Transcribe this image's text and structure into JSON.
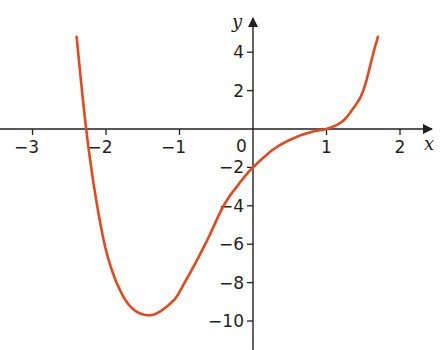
{
  "chart_data": {
    "type": "line",
    "title": "",
    "xlabel": "x",
    "ylabel": "y",
    "xlim": [
      -3.4,
      2.5
    ],
    "ylim": [
      -11.6,
      5.8
    ],
    "grid": false,
    "legend": null,
    "x_ticks": [
      -3,
      -2,
      -1,
      1,
      2
    ],
    "x_tick_labels": [
      "−3",
      "−2",
      "−1",
      "1",
      "2"
    ],
    "y_ticks": [
      4,
      2,
      -2,
      -4,
      -6,
      -8,
      -10
    ],
    "y_tick_labels": [
      "4",
      "2",
      "−2",
      "−4",
      "−6",
      "−8",
      "−10"
    ],
    "origin_label": "0",
    "series": [
      {
        "name": "curve",
        "color": "#e8471c",
        "x": [
          -2.4,
          -2.27,
          -2.12,
          -1.95,
          -1.7,
          -1.4,
          -1.1,
          -0.93,
          -0.65,
          -0.4,
          -0.2,
          0.0,
          0.3,
          0.6,
          0.85,
          1.0,
          1.2,
          1.35,
          1.5,
          1.64,
          1.7
        ],
        "y": [
          4.8,
          0.0,
          -4.0,
          -7.0,
          -9.1,
          -9.7,
          -9.0,
          -8.0,
          -6.0,
          -4.0,
          -2.9,
          -2.0,
          -1.0,
          -0.4,
          -0.1,
          0.0,
          0.35,
          1.0,
          2.0,
          4.0,
          4.8
        ]
      }
    ],
    "key_points": {
      "x_intercepts": [
        -2.27,
        1.0
      ],
      "y_intercept": -2.0,
      "minimum": [
        -1.4,
        -9.7
      ],
      "stationary_inflection": [
        1.0,
        0.0
      ]
    }
  },
  "axes": {
    "x_name": "x",
    "y_name": "y",
    "origin": "0",
    "colors": {
      "axis": "#231f20",
      "curve": "#e8471c"
    }
  }
}
